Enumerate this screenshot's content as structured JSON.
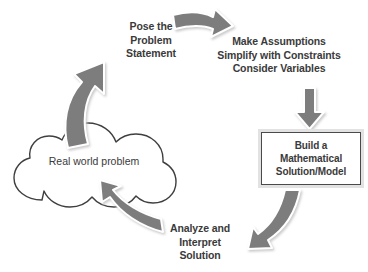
{
  "diagram": {
    "type": "cycle-flow",
    "background_color": "#ffffff",
    "arrow_color": "#7d7d7d",
    "arrow_outline_color": "#ffffff",
    "arrow_shadow_color": "#cfcfcf",
    "text_color": "#3a3a3a",
    "outline_color": "#4a4a4a",
    "nodes": {
      "cloud": {
        "shape": "cloud",
        "label": "Real world problem"
      },
      "model_box": {
        "shape": "rectangle",
        "label_line1": "Build a",
        "label_line2": "Mathematical",
        "label_line3": "Solution/Model"
      }
    },
    "step_labels": {
      "pose": {
        "line1": "Pose the",
        "line2": "Problem",
        "line3": "Statement"
      },
      "assumptions": {
        "line1": "Make Assumptions",
        "line2": "Simplify with Constraints",
        "line3": "Consider Variables"
      },
      "analyze": {
        "line1": "Analyze and",
        "line2": "Interpret",
        "line3": "Solution"
      }
    },
    "arrows": [
      {
        "name": "cloud-to-pose-arrow",
        "direction": "up-right",
        "style": "curved-block"
      },
      {
        "name": "pose-to-assumptions-arrow",
        "direction": "right",
        "style": "curved-block"
      },
      {
        "name": "assumptions-to-model-arrow",
        "direction": "down",
        "style": "straight-block"
      },
      {
        "name": "model-to-analyze-arrow",
        "direction": "down-left",
        "style": "curved-block"
      },
      {
        "name": "analyze-to-cloud-arrow",
        "direction": "up-left",
        "style": "curved-block"
      }
    ]
  }
}
